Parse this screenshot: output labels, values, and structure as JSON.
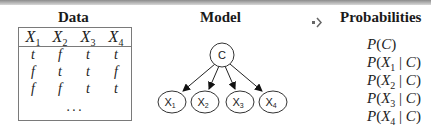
{
  "sections": {
    "data": {
      "title": "Data",
      "columns": [
        "X1",
        "X2",
        "X3",
        "X4"
      ],
      "rows": [
        [
          "t",
          "f",
          "t",
          "t"
        ],
        [
          "f",
          "t",
          "t",
          "f"
        ],
        [
          "f",
          "f",
          "t",
          "t"
        ]
      ],
      "ellipsis": "..."
    },
    "model": {
      "title": "Model",
      "root": "C",
      "children": [
        "X1",
        "X2",
        "X3",
        "X4"
      ]
    },
    "probabilities": {
      "title": "Probabilities",
      "items": [
        "P(C)",
        "P(X1 | C)",
        "P(X2 | C)",
        "P(X3 | C)",
        "P(X4 | C)"
      ]
    }
  },
  "icons": {
    "arrow": "arrow-right-icon"
  }
}
